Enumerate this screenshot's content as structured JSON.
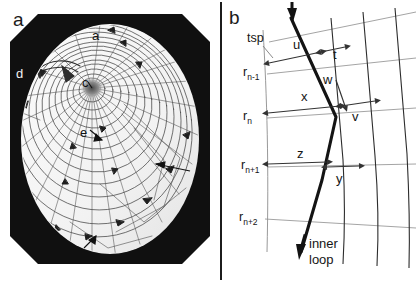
{
  "figure": {
    "width": 416,
    "height": 282,
    "background": "#ffffff",
    "divider_color": "#1c1c1c"
  },
  "panel_a": {
    "label": "a",
    "caption_type": "photograph",
    "description": "orb web photograph in circular frame",
    "frame_color": "#101010",
    "web_color": "#3a3a3a",
    "feature_labels": [
      {
        "id": "a",
        "text": "a",
        "x": 88,
        "y": 21,
        "style": "dark",
        "note": "upper capture spiral"
      },
      {
        "id": "d",
        "text": "d",
        "x": 12,
        "y": 59,
        "style": "light",
        "note": "frame / anchor region"
      },
      {
        "id": "c",
        "text": "c",
        "x": 78,
        "y": 68,
        "style": "dark",
        "note": "hub"
      },
      {
        "id": "e",
        "text": "e",
        "x": 76,
        "y": 118,
        "style": "dark",
        "note": "radius"
      },
      {
        "id": "b",
        "text": "b",
        "x": 74,
        "y": 241,
        "style": "dark",
        "note": "lower capture spiral"
      },
      {
        "id": "f",
        "text": "f",
        "x": 193,
        "y": 163,
        "style": "dark",
        "note": "outer spiral turn"
      }
    ]
  },
  "panel_b": {
    "label": "b",
    "caption_type": "schematic",
    "axis_labels": [
      {
        "id": "tsp",
        "base": "tsp",
        "sub": "",
        "x": 28,
        "y": 36
      },
      {
        "id": "r_nm1",
        "base": "r",
        "sub": "n-1",
        "x": 26,
        "y": 70
      },
      {
        "id": "r_n",
        "base": "r",
        "sub": "n",
        "x": 26,
        "y": 114
      },
      {
        "id": "r_np1",
        "base": "r",
        "sub": "n+1",
        "x": 26,
        "y": 163
      },
      {
        "id": "r_np2",
        "base": "r",
        "sub": "n+2",
        "x": 26,
        "y": 215
      }
    ],
    "segment_labels": [
      {
        "id": "u",
        "text": "u",
        "x": 70,
        "y": 45
      },
      {
        "id": "t",
        "text": "t",
        "x": 110,
        "y": 55
      },
      {
        "id": "w",
        "text": "w",
        "x": 104,
        "y": 79
      },
      {
        "id": "x",
        "text": "x",
        "x": 80,
        "y": 97
      },
      {
        "id": "v",
        "text": "v",
        "x": 128,
        "y": 113
      },
      {
        "id": "z",
        "text": "z",
        "x": 77,
        "y": 154
      },
      {
        "id": "y",
        "text": "y",
        "x": 113,
        "y": 178
      }
    ],
    "annotations": [
      {
        "id": "inner-loop",
        "text": "inner\nloop",
        "line1": "inner",
        "line2": "loop",
        "x": 84,
        "y": 240
      }
    ],
    "colors": {
      "radius_line": "#8c8c8c",
      "spiral_line": "#1a1a1a",
      "thread_line": "#2a2a2a",
      "dimension_arrow": "#333333",
      "text": "#151515"
    }
  }
}
